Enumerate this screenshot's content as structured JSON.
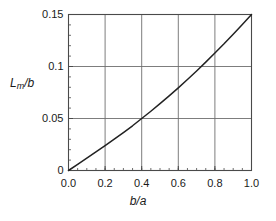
{
  "chart_data": {
    "type": "line",
    "title": "",
    "xlabel": "b/a",
    "ylabel": "L_m/b",
    "ylabel_parts": {
      "base": "L",
      "sub": "m",
      "rest": "/b"
    },
    "xlim": [
      0.0,
      1.0
    ],
    "ylim": [
      0.0,
      0.15
    ],
    "grid": true,
    "legend": "none",
    "xticks": [
      0.0,
      0.2,
      0.4,
      0.6,
      0.8,
      1.0
    ],
    "xticklabels": [
      "0.0",
      "0.2",
      "0.4",
      "0.6",
      "0.8",
      "1.0"
    ],
    "yticks": [
      0.0,
      0.05,
      0.1,
      0.15
    ],
    "yticklabels": [
      "0",
      "0.05",
      "0.1",
      "0.15"
    ],
    "xminor_step": 0.05,
    "yminor_step": 0.01,
    "series": [
      {
        "name": "Lm/b vs b/a",
        "color": "#222222",
        "x": [
          0.0,
          0.05,
          0.1,
          0.15,
          0.2,
          0.25,
          0.3,
          0.35,
          0.4,
          0.45,
          0.5,
          0.55,
          0.6,
          0.65,
          0.7,
          0.75,
          0.8,
          0.85,
          0.9,
          0.95,
          1.0
        ],
        "y": [
          0.0,
          0.0058,
          0.0118,
          0.0178,
          0.024,
          0.0302,
          0.0365,
          0.043,
          0.05,
          0.057,
          0.0643,
          0.0718,
          0.0795,
          0.0875,
          0.0957,
          0.1042,
          0.113,
          0.1218,
          0.131,
          0.1403,
          0.15
        ]
      }
    ]
  },
  "colors": {
    "axis": "#4a4a4a",
    "grid": "#6e6e6e",
    "curve": "#222222",
    "background": "#ffffff",
    "text": "#1a1a1a"
  }
}
